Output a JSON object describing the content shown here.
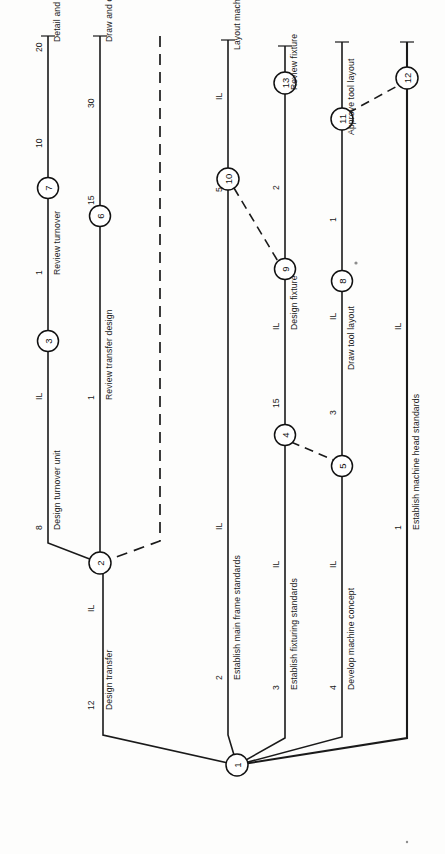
{
  "diagram": {
    "orientation": "rotated-90",
    "colors": {
      "line": "#1a1a1a",
      "node_fill": "#ffffff",
      "background": "#fdfdfc"
    },
    "start_node": "1",
    "nodes": [
      {
        "id": "n1",
        "label": "1",
        "x": 237,
        "y": 765
      },
      {
        "id": "n2",
        "label": "2",
        "x": 100,
        "y": 563
      },
      {
        "id": "n3",
        "label": "3",
        "x": 45,
        "y": 341
      },
      {
        "id": "n6",
        "label": "6",
        "x": 100,
        "y": 216
      },
      {
        "id": "n7",
        "label": "7",
        "x": 45,
        "y": 188
      },
      {
        "id": "n4",
        "label": "4",
        "x": 285,
        "y": 435
      },
      {
        "id": "n5",
        "label": "5",
        "x": 342,
        "y": 466
      },
      {
        "id": "n9",
        "label": "9",
        "x": 285,
        "y": 269
      },
      {
        "id": "n10",
        "label": "10",
        "x": 228,
        "y": 179
      },
      {
        "id": "n13",
        "label": "13",
        "x": 285,
        "y": 83
      },
      {
        "id": "n8",
        "label": "8",
        "x": 342,
        "y": 281
      },
      {
        "id": "n11",
        "label": "11",
        "x": 342,
        "y": 119
      },
      {
        "id": "n12",
        "label": "12",
        "x": 407,
        "y": 78
      }
    ],
    "activities": [
      {
        "id": "a12",
        "name": "Design transfer",
        "duration": "12",
        "tick": "IL",
        "from": "1",
        "to": "2"
      },
      {
        "id": "a8",
        "name": "Design turnover unit",
        "duration": "8",
        "tick": "IL",
        "from": "2",
        "to": "3"
      },
      {
        "id": "a1a",
        "name": "Review turnover",
        "duration": "1",
        "tick": "",
        "from": "3",
        "to": "7"
      },
      {
        "id": "a10",
        "name": "Detail and check turnover",
        "duration": "10",
        "tick": "20",
        "from": "7",
        "to": "end"
      },
      {
        "id": "a1b",
        "name": "Review transfer design",
        "duration": "1",
        "tick": "",
        "from": "2",
        "to": "6"
      },
      {
        "id": "a15a",
        "name": "Draw and check transfer details",
        "duration": "15",
        "tick": "30",
        "from": "6",
        "to": "end"
      },
      {
        "id": "adum",
        "name": "",
        "duration": "",
        "tick": "",
        "from": "2",
        "to": "end",
        "dummy": true
      },
      {
        "id": "a2a",
        "name": "Establish main frame standards",
        "duration": "2",
        "tick": "IL",
        "from": "1",
        "to": "10"
      },
      {
        "id": "a5",
        "name": "Layout machine",
        "duration": "5",
        "tick": "IL",
        "from": "10",
        "to": "end"
      },
      {
        "id": "a3a",
        "name": "Establish fixturing standards",
        "duration": "3",
        "tick": "IL",
        "from": "1",
        "to": "4"
      },
      {
        "id": "a15b",
        "name": "Design fixture",
        "duration": "15",
        "tick": "IL",
        "from": "4",
        "to": "9"
      },
      {
        "id": "a2b",
        "name": "Review fixture",
        "duration": "2",
        "tick": "",
        "from": "9",
        "to": "13"
      },
      {
        "id": "a4",
        "name": "Develop machine concept",
        "duration": "4",
        "tick": "IL",
        "from": "1",
        "to": "5"
      },
      {
        "id": "a3b",
        "name": "Draw tool layout",
        "duration": "3",
        "tick": "IL",
        "from": "5",
        "to": "8"
      },
      {
        "id": "a1c",
        "name": "Approve tool layout",
        "duration": "1",
        "tick": "",
        "from": "8",
        "to": "11"
      },
      {
        "id": "a1d",
        "name": "Establish machine head standards",
        "duration": "1",
        "tick": "IL",
        "from": "1",
        "to": "12"
      }
    ],
    "dummy_links": [
      {
        "from": "10",
        "to": "9"
      },
      {
        "from": "4",
        "to": "5"
      },
      {
        "from": "11",
        "to": "12"
      }
    ],
    "labels": {
      "design_transfer": "Design transfer",
      "design_turnover_unit": "Design turnover unit",
      "review_turnover": "Review turnover",
      "detail_check_turnover": "Detail and check turnover",
      "review_transfer_design": "Review transfer design",
      "draw_check_transfer_details": "Draw and check transfer details",
      "establish_main_frame_standards": "Establish main frame standards",
      "layout_machine": "Layout machine",
      "establish_fixturing_standards": "Establish fixturing standards",
      "design_fixture": "Design fixture",
      "review_fixture": "Review fixture",
      "develop_machine_concept": "Develop machine concept",
      "draw_tool_layout": "Draw tool layout",
      "approve_tool_layout": "Approve tool layout",
      "establish_machine_head_standards": "Establish machine head standards"
    },
    "durations": {
      "d12": "12",
      "d8": "8",
      "d1a": "1",
      "d10": "10",
      "d20": "20",
      "d1b": "1",
      "d15a": "15",
      "d30": "30",
      "d2a": "2",
      "d5": "5",
      "d3a": "3",
      "d15b": "15",
      "d2b": "2",
      "d4": "4",
      "d3b": "3",
      "d1c": "1",
      "d1d": "1"
    },
    "ticks": {
      "t_design_transfer": "IL",
      "t_design_turnover": "IL",
      "t_main_frame": "IL",
      "t_layout_machine": "IL",
      "t_fixturing": "IL",
      "t_design_fixture": "IL",
      "t_machine_concept": "IL",
      "t_draw_tool_layout": "IL",
      "t_draw_tool_layout2": "IL",
      "t_machine_head": "IL",
      "t_machine_head2": "IL"
    },
    "node_labels": {
      "n1": "1",
      "n2": "2",
      "n3": "3",
      "n4": "4",
      "n5": "5",
      "n6": "6",
      "n7": "7",
      "n8": "8",
      "n9": "9",
      "n10": "10",
      "n11": "11",
      "n12": "12",
      "n13": "13"
    }
  }
}
